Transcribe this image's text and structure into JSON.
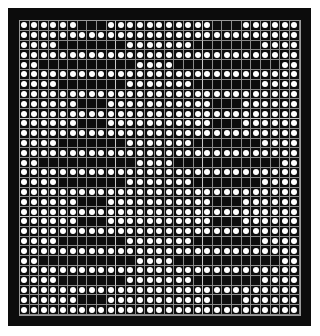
{
  "board": {
    "columns": 29,
    "rows": 30,
    "on_color": "#ffffff",
    "off_color": "#0c0c0c",
    "frame_color": "#0c0c0c",
    "legend": "1 = black (empty) cell, 0 = white circle",
    "pattern": [
      "00000011100000000000111000000",
      "00000000000000000000000000000",
      "00001111111000000011111110000",
      "00000000000000000000000000000",
      "00111111111100001111111111100",
      "00000000000000000000000000000",
      "00001111111000000011111110000",
      "00000000000000000000000000000",
      "00000011100000000000111000000",
      "00000000000000000000000000000",
      "00000011100000000000111000000",
      "00000000000000000000000000000",
      "00001111111000000011111110000",
      "00000000000000000000000000000",
      "00111111111100001111111111100",
      "00000000000000000000000000000",
      "00001111111000000011111110000",
      "00000000000000000000000000000",
      "00000011100000000000111000000",
      "00000000000000000000000000000",
      "00000011100000000000111000000",
      "00000000000000000000000000000",
      "00001111111000000011111110000",
      "00000000000000000000000000000",
      "00111111111100001111111111100",
      "00000000000000000000000000000",
      "00001111111000000011111110000",
      "00000000000000000000000000000",
      "00000011100000000000111000000",
      "00000000000000000000000000000"
    ]
  }
}
